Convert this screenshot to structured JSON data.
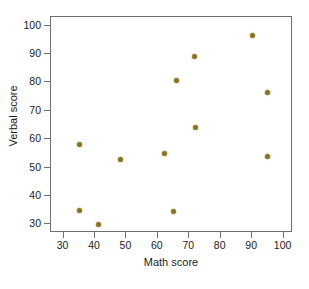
{
  "chart_data": {
    "type": "scatter",
    "title": "",
    "xlabel": "Math score",
    "ylabel": "Verbal score",
    "xlim": [
      26,
      103
    ],
    "ylim": [
      27,
      103
    ],
    "xticks": [
      30,
      40,
      50,
      60,
      70,
      80,
      90,
      100
    ],
    "yticks": [
      30,
      40,
      50,
      60,
      70,
      80,
      90,
      100
    ],
    "grid": false,
    "legend": null,
    "marker_color": "#8a7420",
    "frame_color": "#6f6f6f",
    "background": "#ffffff",
    "series": [
      {
        "name": "students",
        "points": [
          {
            "x": 35,
            "y": 58
          },
          {
            "x": 35,
            "y": 35
          },
          {
            "x": 41,
            "y": 30
          },
          {
            "x": 48,
            "y": 53
          },
          {
            "x": 62,
            "y": 55
          },
          {
            "x": 65,
            "y": 34.5
          },
          {
            "x": 66,
            "y": 80.5
          },
          {
            "x": 71.5,
            "y": 89
          },
          {
            "x": 72,
            "y": 64
          },
          {
            "x": 90,
            "y": 96.5
          },
          {
            "x": 95,
            "y": 76.5
          },
          {
            "x": 95,
            "y": 54
          }
        ]
      }
    ]
  }
}
